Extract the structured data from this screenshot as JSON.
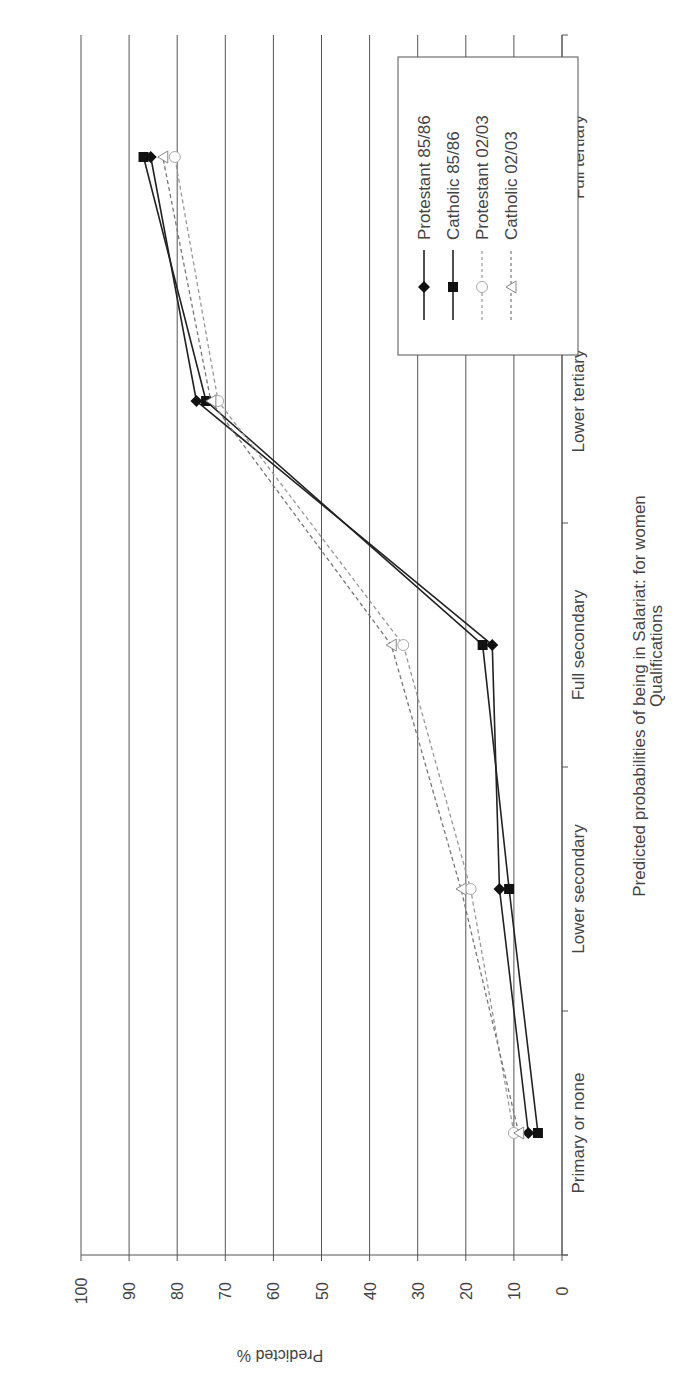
{
  "chart_data": {
    "type": "line",
    "title": "Predicted probabilities of being in Salariat: for women",
    "xlabel": "Qualifications",
    "ylabel": "Predicted %",
    "categories": [
      "Primary or none",
      "Lower secondary",
      "Full secondary",
      "Lower tertiary",
      "Full tertiary"
    ],
    "ylim": [
      0,
      100
    ],
    "yticks": [
      0,
      10,
      20,
      30,
      40,
      50,
      60,
      70,
      80,
      90,
      100
    ],
    "grid": true,
    "legend_position": "upper-left (rotated)",
    "orientation": "rotated 90 degrees clockwise",
    "series": [
      {
        "name": "Protestant 85/86",
        "values": [
          7,
          13,
          14.5,
          76,
          85.5
        ],
        "marker": "diamond",
        "line": "solid",
        "color": "#222222"
      },
      {
        "name": "Catholic 85/86",
        "values": [
          5,
          11,
          16.5,
          74,
          87
        ],
        "marker": "square",
        "line": "solid",
        "color": "#222222"
      },
      {
        "name": "Protestant 02/03",
        "values": [
          10,
          19,
          33,
          71.5,
          80.5
        ],
        "marker": "circle-open",
        "line": "dashed",
        "color": "#999999"
      },
      {
        "name": "Catholic 02/03",
        "values": [
          9,
          21,
          35.5,
          73,
          83
        ],
        "marker": "triangle-open",
        "line": "dashed",
        "color": "#777777"
      }
    ]
  },
  "legend": {
    "items": [
      {
        "label": "Protestant 85/86"
      },
      {
        "label": "Catholic 85/86"
      },
      {
        "label": "Protestant 02/03"
      },
      {
        "label": "Catholic 02/03"
      }
    ]
  }
}
